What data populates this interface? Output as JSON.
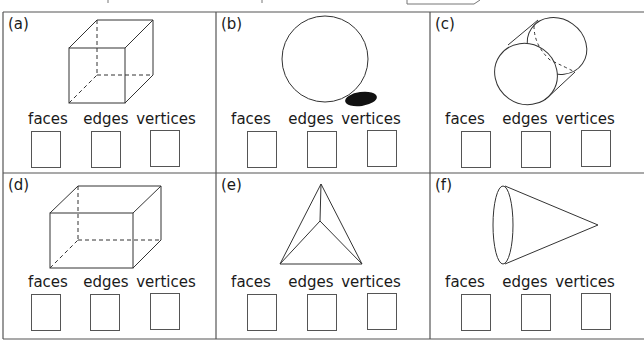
{
  "worksheet": {
    "column_headers": [
      "faces",
      "edges",
      "vertices"
    ],
    "panels": [
      {
        "id": "a",
        "label": "(a)",
        "shape": "cube",
        "answers": {
          "faces": "",
          "edges": "",
          "vertices": ""
        }
      },
      {
        "id": "b",
        "label": "(b)",
        "shape": "sphere",
        "answers": {
          "faces": "",
          "edges": "",
          "vertices": ""
        }
      },
      {
        "id": "c",
        "label": "(c)",
        "shape": "cylinder",
        "answers": {
          "faces": "",
          "edges": "",
          "vertices": ""
        }
      },
      {
        "id": "d",
        "label": "(d)",
        "shape": "cuboid",
        "answers": {
          "faces": "",
          "edges": "",
          "vertices": ""
        }
      },
      {
        "id": "e",
        "label": "(e)",
        "shape": "triangular-pyramid",
        "answers": {
          "faces": "",
          "edges": "",
          "vertices": ""
        }
      },
      {
        "id": "f",
        "label": "(f)",
        "shape": "cone",
        "answers": {
          "faces": "",
          "edges": "",
          "vertices": ""
        }
      }
    ]
  },
  "colors": {
    "line": "#333333",
    "grid": "#555555",
    "shadow": "#111111"
  }
}
